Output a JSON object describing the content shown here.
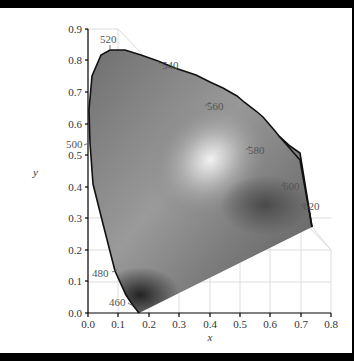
{
  "diagram": {
    "x_axis": {
      "label": "x",
      "ticks": [
        "0.0",
        "0.1",
        "0.2",
        "0.3",
        "0.4",
        "0.5",
        "0.6",
        "0.7",
        "0.8"
      ]
    },
    "y_axis": {
      "label": "y",
      "ticks": [
        "0.0",
        "0.1",
        "0.2",
        "0.3",
        "0.4",
        "0.5",
        "0.6",
        "0.7",
        "0.8",
        "0.9"
      ]
    },
    "wavelength_labels": [
      "460",
      "480",
      "500",
      "520",
      "540",
      "560",
      "580",
      "600",
      "620"
    ],
    "colors": {
      "background": "#ffffff",
      "border": "#000000",
      "grid": "#dddddd",
      "locus": "#111111"
    }
  }
}
